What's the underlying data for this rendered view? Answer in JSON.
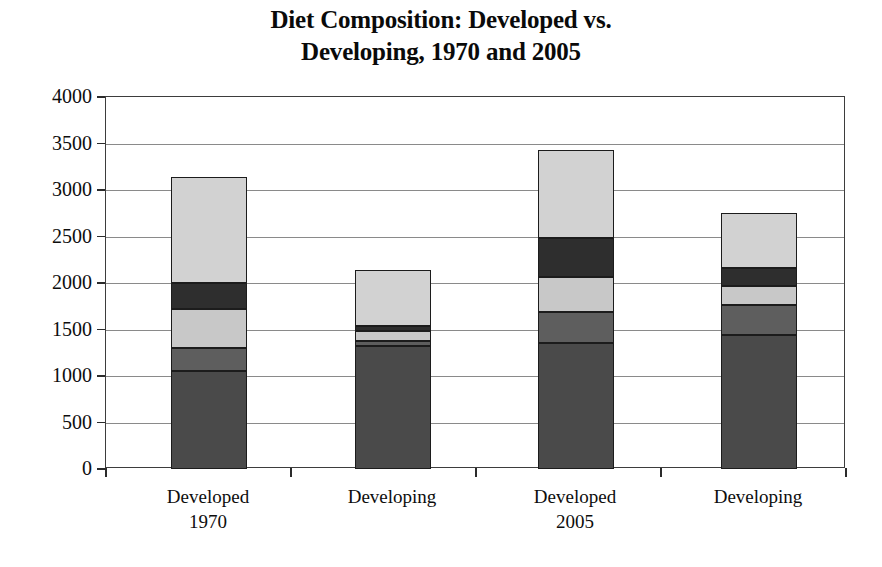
{
  "chart_data": {
    "type": "bar",
    "subtype": "stacked-bar",
    "title": "Diet Composition: Developed vs. Developing, 1970 and 2005",
    "title_lines": [
      "Diet Composition: Developed vs.",
      "Developing, 1970 and 2005"
    ],
    "xlabel": "",
    "ylabel": "",
    "ylim": [
      0,
      4000
    ],
    "ytick_step": 500,
    "ytick_labels": [
      "4000",
      "3500",
      "3000",
      "2500",
      "2000",
      "1500",
      "1000",
      "500",
      "0"
    ],
    "ytick_values": [
      4000,
      3500,
      3000,
      2500,
      2000,
      1500,
      1000,
      500,
      0
    ],
    "grid": true,
    "legend": false,
    "categories": [
      "Developed",
      "Developing",
      "Developed",
      "Developing"
    ],
    "category_years": [
      "1970",
      "",
      "2005",
      ""
    ],
    "series": [
      {
        "name": "segment-1",
        "color": "#4a4a4a",
        "values": [
          1050,
          1320,
          1350,
          1440
        ]
      },
      {
        "name": "segment-2",
        "color": "#5e5e5e",
        "values": [
          250,
          55,
          340,
          320
        ]
      },
      {
        "name": "segment-3",
        "color": "#c8c8c8",
        "values": [
          420,
          110,
          370,
          210
        ]
      },
      {
        "name": "segment-4",
        "color": "#2e2e2e",
        "values": [
          280,
          50,
          420,
          190
        ]
      },
      {
        "name": "segment-5",
        "color": "#d2d2d2",
        "values": [
          1140,
          610,
          950,
          595
        ]
      }
    ],
    "totals": [
      3140,
      2145,
      3430,
      2755
    ],
    "cumulative": [
      [
        1050,
        1300,
        1720,
        2000,
        3140
      ],
      [
        1320,
        1375,
        1485,
        1535,
        2145
      ],
      [
        1350,
        1690,
        2060,
        2480,
        3430
      ],
      [
        1440,
        1760,
        1970,
        2160,
        2755
      ]
    ],
    "colors": {
      "segment_1": "#4a4a4a",
      "segment_2": "#5e5e5e",
      "segment_3": "#c8c8c8",
      "segment_4": "#2e2e2e",
      "segment_5": "#d2d2d2",
      "axis": "#2b2b2b",
      "grid": "#8a8a8a",
      "frame": "#3d3d3d",
      "background": "#ffffff",
      "text": "#0d0d0d"
    }
  }
}
